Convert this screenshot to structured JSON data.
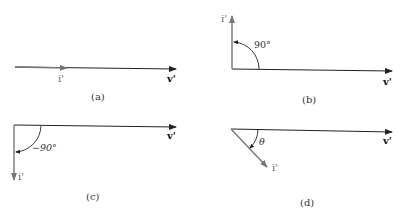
{
  "panels": [
    {
      "id": "a",
      "caption": "(a)",
      "current_label": "i'",
      "voltage_label": "v'",
      "angle_label": "",
      "description": "i' in phase with v'"
    },
    {
      "id": "b",
      "caption": "(b)",
      "current_label": "i'",
      "voltage_label": "v'",
      "angle_label": "90°",
      "description": "i' leads v' by 90°"
    },
    {
      "id": "c",
      "caption": "(c)",
      "current_label": "i'",
      "voltage_label": "v'",
      "angle_label": "−90°",
      "description": "i' lags v' by 90°"
    },
    {
      "id": "d",
      "caption": "(d)",
      "current_label": "i'",
      "voltage_label": "v'",
      "angle_label": "θ",
      "description": "i' lags v' by angle θ"
    }
  ],
  "colors": {
    "voltage_phasor": "#222222",
    "current_phasor": "#777777",
    "arc": "#222222"
  }
}
